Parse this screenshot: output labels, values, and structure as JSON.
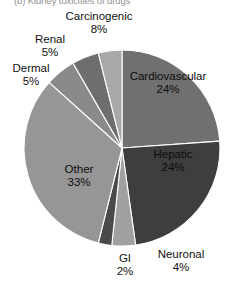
{
  "caption": "(b) Kidney toxicities of drugs",
  "chart_data": {
    "type": "pie",
    "title": "",
    "subtitle": "",
    "xlabel": "",
    "ylabel": "",
    "grid": false,
    "legend_position": "none",
    "label_format": "name + percent",
    "start_angle_deg": 0,
    "direction": "clockwise",
    "categories": [
      "Cardiovascular",
      "Hepatic",
      "Neuronal",
      "GI",
      "Other",
      "Dermal",
      "Renal",
      "Carcinogenic"
    ],
    "values": [
      24,
      24,
      4,
      2,
      33,
      5,
      5,
      8
    ],
    "value_labels": [
      "24%",
      "24%",
      "4%",
      "2%",
      "33%",
      "5%",
      "5%",
      "8%"
    ],
    "colors": [
      "#707070",
      "#3e3e3e",
      "#a0a0a0",
      "#4a4a4a",
      "#969696",
      "#8a8a8a",
      "#6e6e6e",
      "#a8a8a8"
    ],
    "slices": [
      {
        "name": "Cardiovascular",
        "value": 24,
        "label": "Cardiovascular",
        "pct": "24%",
        "color": "#707070",
        "start_deg": 0,
        "end_deg": 86
      },
      {
        "name": "Hepatic",
        "value": 24,
        "label": "Hepatic",
        "pct": "24%",
        "color": "#3e3e3e",
        "start_deg": 86,
        "end_deg": 172
      },
      {
        "name": "Neuronal",
        "value": 4,
        "label": "Neuronal",
        "pct": "4%",
        "color": "#a0a0a0",
        "start_deg": 172,
        "end_deg": 186
      },
      {
        "name": "GI",
        "value": 2,
        "label": "GI",
        "pct": "2%",
        "color": "#4a4a4a",
        "start_deg": 186,
        "end_deg": 194
      },
      {
        "name": "Other",
        "value": 33,
        "label": "Other",
        "pct": "33%",
        "color": "#969696",
        "start_deg": 194,
        "end_deg": 312
      },
      {
        "name": "Dermal",
        "value": 5,
        "label": "Dermal",
        "pct": "5%",
        "color": "#8a8a8a",
        "start_deg": 312,
        "end_deg": 330
      },
      {
        "name": "Renal",
        "value": 5,
        "label": "Renal",
        "pct": "5%",
        "color": "#6e6e6e",
        "start_deg": 330,
        "end_deg": 346
      },
      {
        "name": "Carcinogenic",
        "value": 8,
        "label": "Carcinogenic",
        "pct": "8%",
        "color": "#a8a8a8",
        "start_deg": 346,
        "end_deg": 360
      }
    ],
    "geometry": {
      "cx": 122,
      "cy": 148,
      "r": 98
    }
  }
}
